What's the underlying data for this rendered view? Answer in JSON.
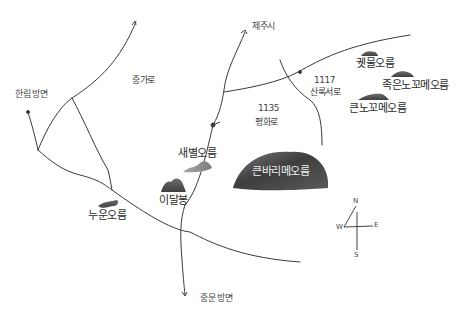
{
  "map": {
    "title": "",
    "directions": {
      "jeju_city": "제주시",
      "hallim": "한림 방면",
      "jungmun": "중문 방면"
    },
    "roads": {
      "jungsan": "중가로",
      "pyeonghwa_no": "1135",
      "pyeonghwa_name": "평화로",
      "sanrok_no": "1117",
      "sanrok_name": "산록서로"
    },
    "oreums": [
      {
        "id": "saebyeol",
        "label": "새별오름"
      },
      {
        "id": "idalbong",
        "label": "이달봉"
      },
      {
        "id": "nuun",
        "label": "누운오름"
      },
      {
        "id": "keunbari",
        "label": "큰바리메오름"
      },
      {
        "id": "kettongul",
        "label": "궷물오름"
      },
      {
        "id": "jokeunnokkomae",
        "label": "족은노꼬메오름"
      },
      {
        "id": "keunnokkomae",
        "label": "큰노꼬메오름"
      }
    ],
    "compass": {
      "n": "N",
      "e": "E",
      "w": "W",
      "s": "S"
    },
    "colors": {
      "ink": "#3a3a3a",
      "mountain_dark": "#4a4a4a",
      "mountain_light": "#8a8a8a"
    }
  }
}
